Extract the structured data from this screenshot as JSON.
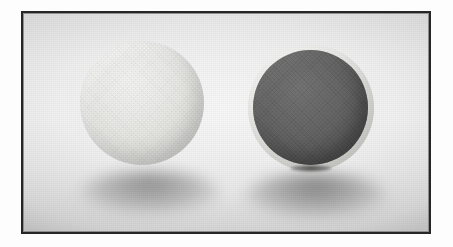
{
  "image": {
    "medium": "grayscale-photograph",
    "subject": "two spheres on a light surface",
    "frame": {
      "border_color": "#262626",
      "border_width_px": 2,
      "margin_color": "#ffffff"
    },
    "backdrop": {
      "name": "seamless-light-backdrop",
      "top_color": "#e4e4e4",
      "mid_color": "#efefef",
      "bottom_color": "#dcdcdc"
    },
    "objects": [
      {
        "id": "sphere-light",
        "label": "light sphere",
        "position": "left",
        "surface": "matte textured",
        "tone": "pale light gray",
        "fill_color": "#e9e9e6",
        "highlight_color": "#f4f4f2",
        "shade_color": "#c4c4c0",
        "has_cast_shadow": true
      },
      {
        "id": "sphere-dark",
        "label": "dark sphere",
        "position": "right",
        "surface": "dark coated with pale uncoated rim",
        "tone": "dark gray",
        "fill_color": "#636363",
        "highlight_color": "#717171",
        "shade_color": "#484848",
        "rim_color": "#e9e9e6",
        "has_cast_shadow": true,
        "has_contact_mark": true
      }
    ],
    "shadows": [
      {
        "id": "shadow-left",
        "belongs_to": "sphere-light",
        "type": "soft cast shadow"
      },
      {
        "id": "shadow-right",
        "belongs_to": "sphere-dark",
        "type": "soft cast shadow"
      }
    ]
  }
}
